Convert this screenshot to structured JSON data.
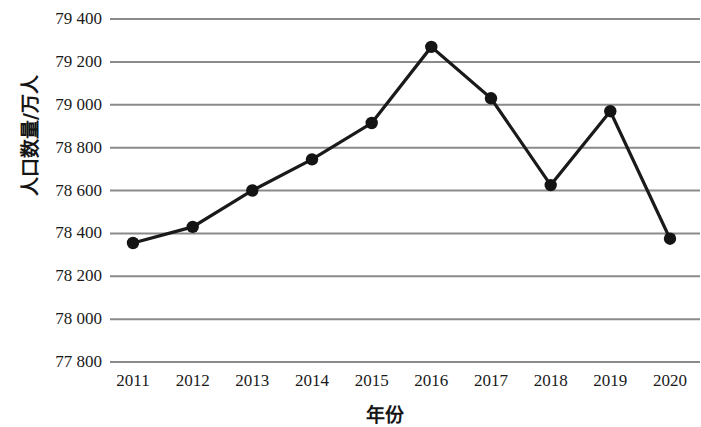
{
  "chart_data": {
    "type": "line",
    "title": "",
    "xlabel": "年份",
    "ylabel": "人口数量/万人",
    "categories": [
      "2011",
      "2012",
      "2013",
      "2014",
      "2015",
      "2016",
      "2017",
      "2018",
      "2019",
      "2020"
    ],
    "values": [
      78355,
      78430,
      78600,
      78745,
      78915,
      79270,
      79030,
      78625,
      78970,
      78375
    ],
    "series": [
      {
        "name": "人口数量",
        "values": [
          78355,
          78430,
          78600,
          78745,
          78915,
          79270,
          79030,
          78625,
          78970,
          78375
        ]
      }
    ],
    "ylim": [
      77800,
      79400
    ],
    "ytick_values": [
      79400,
      79200,
      79000,
      78800,
      78600,
      78400,
      78200,
      78000,
      77800
    ],
    "ytick_labels": [
      "79 400",
      "79 200",
      "79 000",
      "78 800",
      "78 600",
      "78 400",
      "78 200",
      "78 000",
      "77 800"
    ],
    "grid": true,
    "legend": "none",
    "line_color": "#1a1a1a",
    "marker_color": "#141414",
    "grid_color": "#8a8a8a",
    "background": "#ffffff"
  }
}
